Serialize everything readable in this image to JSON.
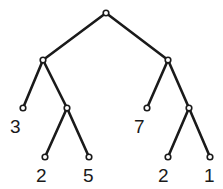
{
  "diagram": {
    "type": "binary-tree",
    "nodes": [
      {
        "id": "root",
        "x": 106,
        "y": 13
      },
      {
        "id": "L",
        "x": 43,
        "y": 60
      },
      {
        "id": "R",
        "x": 168,
        "y": 60
      },
      {
        "id": "LL",
        "x": 23,
        "y": 108,
        "value": "3",
        "lx": 10,
        "ly": 133
      },
      {
        "id": "LR",
        "x": 67,
        "y": 108
      },
      {
        "id": "LRL",
        "x": 45,
        "y": 157,
        "value": "2",
        "lx": 36,
        "ly": 182
      },
      {
        "id": "LRR",
        "x": 89,
        "y": 157,
        "value": "5",
        "lx": 83,
        "ly": 182
      },
      {
        "id": "RL",
        "x": 147,
        "y": 108,
        "value": "7",
        "lx": 134,
        "ly": 133
      },
      {
        "id": "RR",
        "x": 189,
        "y": 108
      },
      {
        "id": "RRL",
        "x": 168,
        "y": 157,
        "value": "2",
        "lx": 158,
        "ly": 182
      },
      {
        "id": "RRR",
        "x": 210,
        "y": 157,
        "value": "1",
        "lx": 204,
        "ly": 182
      }
    ],
    "edges": [
      [
        "root",
        "L"
      ],
      [
        "root",
        "R"
      ],
      [
        "L",
        "LL"
      ],
      [
        "L",
        "LR"
      ],
      [
        "LR",
        "LRL"
      ],
      [
        "LR",
        "LRR"
      ],
      [
        "R",
        "RL"
      ],
      [
        "R",
        "RR"
      ],
      [
        "RR",
        "RRL"
      ],
      [
        "RR",
        "RRR"
      ]
    ],
    "leaf_values": [
      "3",
      "2",
      "5",
      "7",
      "2",
      "1"
    ]
  }
}
